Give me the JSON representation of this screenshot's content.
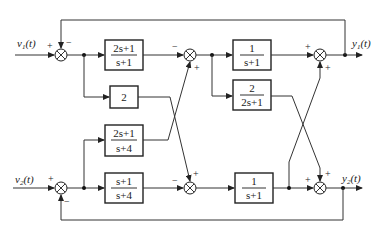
{
  "diagram": {
    "title": "",
    "inputs": [
      {
        "id": "v1",
        "label_main": "v",
        "label_sub": "1",
        "label_tail": "(t)"
      },
      {
        "id": "v2",
        "label_main": "v",
        "label_sub": "2",
        "label_tail": "(t)"
      }
    ],
    "outputs": [
      {
        "id": "y1",
        "label_main": "y",
        "label_sub": "1",
        "label_tail": "(t)"
      },
      {
        "id": "y2",
        "label_main": "y",
        "label_sub": "2",
        "label_tail": "(t)"
      }
    ],
    "blocks": [
      {
        "id": "G11",
        "num": "2s+1",
        "den": "s+1"
      },
      {
        "id": "K2",
        "num": "2",
        "den": ""
      },
      {
        "id": "G21",
        "num": "2s+1",
        "den": "s+4"
      },
      {
        "id": "G22",
        "num": "s+1",
        "den": "s+4"
      },
      {
        "id": "H1",
        "num": "1",
        "den": "s+1"
      },
      {
        "id": "H12",
        "num": "2",
        "den": "2s+1"
      },
      {
        "id": "H2",
        "num": "1",
        "den": "s+1"
      }
    ],
    "summing_junctions": [
      {
        "id": "S1",
        "signs": [
          "+",
          "−"
        ]
      },
      {
        "id": "S2",
        "signs": [
          "−",
          "+"
        ]
      },
      {
        "id": "S3",
        "signs": [
          "+",
          "+"
        ]
      },
      {
        "id": "S4",
        "signs": [
          "+",
          "−"
        ]
      },
      {
        "id": "S5",
        "signs": [
          "−",
          "+"
        ]
      },
      {
        "id": "S6",
        "signs": [
          "+",
          "+"
        ]
      }
    ]
  }
}
